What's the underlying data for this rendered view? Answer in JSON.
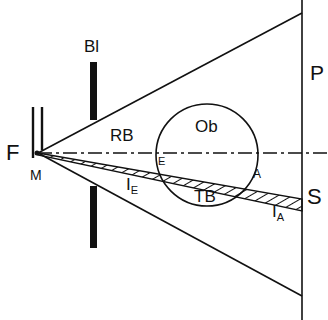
{
  "diagram": {
    "labels": {
      "source": "F",
      "source_sub": "M",
      "aperture": "Bl",
      "reference_beam": "RB",
      "object": "Ob",
      "test_beam": "TB",
      "plate": "P",
      "screen_point": "S",
      "entry_point": "E",
      "exit_point": "A",
      "ray_entry": "I",
      "ray_entry_sub": "E",
      "ray_exit": "I",
      "ray_exit_sub": "A"
    },
    "colors": {
      "ink": "#111111",
      "background": "#ffffff"
    }
  }
}
